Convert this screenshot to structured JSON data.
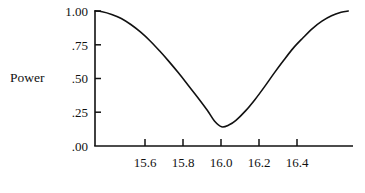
{
  "figure": {
    "background_color": "#ffffff",
    "ink_color": "#111111",
    "y_axis_title": "Power"
  },
  "chart_data": {
    "type": "line",
    "title": "",
    "subtitle": "",
    "xlabel": "",
    "ylabel": "Power",
    "grid": false,
    "legend": null,
    "xlim": [
      15.47,
      16.55
    ],
    "ylim": [
      0.0,
      1.0
    ],
    "xticks": [
      15.6,
      15.8,
      16.0,
      16.2,
      16.4
    ],
    "xtick_labels": [
      "15.6",
      "15.8",
      "16.0",
      "16.2",
      "16.4"
    ],
    "yticks": [
      0.0,
      0.25,
      0.5,
      0.75,
      1.0
    ],
    "ytick_labels": [
      ".00",
      ".25",
      ".50",
      ".75",
      "1.00"
    ],
    "series": [
      {
        "name": "Power curve",
        "color": "#111111",
        "line_width": 1.6,
        "x": [
          15.47,
          15.5,
          15.54,
          15.58,
          15.62,
          15.66,
          15.7,
          15.74,
          15.78,
          15.82,
          15.86,
          15.9,
          15.94,
          15.97,
          16.0,
          16.03,
          16.06,
          16.1,
          16.14,
          16.18,
          16.22,
          16.26,
          16.3,
          16.34,
          16.38,
          16.42,
          16.46,
          16.5,
          16.53
        ],
        "y": [
          1.0,
          0.995,
          0.975,
          0.945,
          0.9,
          0.845,
          0.78,
          0.705,
          0.625,
          0.54,
          0.45,
          0.36,
          0.265,
          0.185,
          0.142,
          0.155,
          0.19,
          0.26,
          0.345,
          0.44,
          0.54,
          0.635,
          0.725,
          0.8,
          0.87,
          0.925,
          0.965,
          0.99,
          1.0
        ]
      }
    ]
  }
}
